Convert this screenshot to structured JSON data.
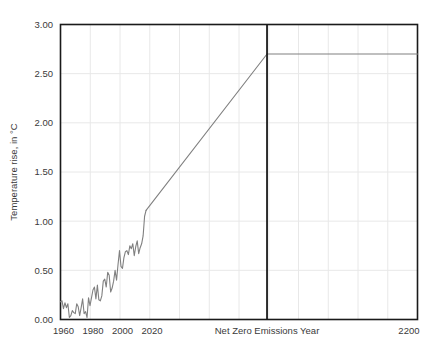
{
  "chart_data": {
    "type": "line",
    "title": "",
    "xlabel": "",
    "ylabel": "Temperature rise, in °C",
    "xlim": [
      1958,
      2200
    ],
    "ylim": [
      0.0,
      3.0
    ],
    "grid": true,
    "legend": false,
    "y_ticks": [
      "0.00",
      "0.50",
      "1.00",
      "1.50",
      "2.00",
      "2.50",
      "3.00"
    ],
    "y_tick_values": [
      0.0,
      0.5,
      1.0,
      1.5,
      2.0,
      2.5,
      3.0
    ],
    "x_ticks": [
      "1960",
      "1980",
      "2000",
      "2020",
      "Net Zero Emissions Year",
      "2200"
    ],
    "x_tick_values": [
      1960,
      1980,
      2000,
      2020,
      2098,
      2200
    ],
    "annotations": [
      {
        "name": "net-zero-emissions-year-line",
        "type": "vline",
        "x": 2098,
        "label": "Net Zero Emissions Year",
        "color": "#1a1a1a"
      }
    ],
    "series": [
      {
        "name": "Historical observed temperature rise",
        "color": "#808080",
        "x": [
          1958,
          1959,
          1960,
          1961,
          1962,
          1963,
          1964,
          1965,
          1966,
          1967,
          1968,
          1969,
          1970,
          1971,
          1972,
          1973,
          1974,
          1975,
          1976,
          1977,
          1978,
          1979,
          1980,
          1981,
          1982,
          1983,
          1984,
          1985,
          1986,
          1987,
          1988,
          1989,
          1990,
          1991,
          1992,
          1993,
          1994,
          1995,
          1996,
          1997,
          1998,
          1999,
          2000,
          2001,
          2002,
          2003,
          2004,
          2005,
          2006,
          2007,
          2008,
          2009,
          2010,
          2011,
          2012,
          2013,
          2014,
          2015,
          2016
        ],
        "y": [
          0.18,
          0.19,
          0.11,
          0.17,
          0.12,
          0.16,
          0.02,
          0.04,
          0.09,
          0.07,
          0.06,
          0.16,
          0.13,
          0.04,
          0.12,
          0.21,
          0.06,
          0.08,
          0.02,
          0.22,
          0.14,
          0.22,
          0.3,
          0.33,
          0.21,
          0.35,
          0.2,
          0.19,
          0.24,
          0.39,
          0.41,
          0.33,
          0.48,
          0.45,
          0.28,
          0.32,
          0.39,
          0.5,
          0.4,
          0.56,
          0.7,
          0.54,
          0.52,
          0.63,
          0.69,
          0.7,
          0.66,
          0.75,
          0.72,
          0.77,
          0.65,
          0.74,
          0.8,
          0.67,
          0.73,
          0.77,
          0.85,
          1.05,
          1.11
        ]
      },
      {
        "name": "Projected warming to net zero",
        "color": "#808080",
        "x": [
          2016,
          2098
        ],
        "y": [
          1.11,
          2.7
        ]
      },
      {
        "name": "Post net zero plateau",
        "color": "#808080",
        "x": [
          2098,
          2200
        ],
        "y": [
          2.7,
          2.7
        ]
      }
    ]
  },
  "colors": {
    "line": "#808080",
    "axis": "#1a1a1a",
    "grid": "#e8e8e8",
    "text": "#3a3a3a",
    "background": "#ffffff"
  }
}
